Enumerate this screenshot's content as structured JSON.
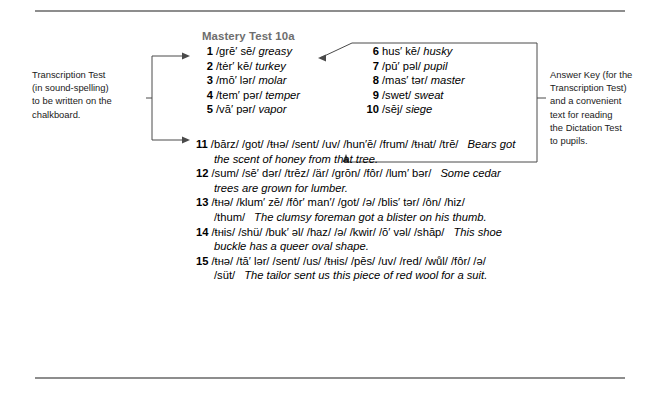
{
  "annotations": {
    "left": "Transcription Test\n(in sound-spelling)\nto be written on the\nchalkboard.",
    "right": "Answer Key (for the\nTranscription Test)\nand a convenient\ntext for reading\nthe Dictation Test\nto pupils."
  },
  "test": {
    "title": "Mastery Test 10a",
    "words_left": [
      {
        "num": "1",
        "phonetic": "/grē′ sē/",
        "word": "greasy"
      },
      {
        "num": "2",
        "phonetic": "/tėr′ kē/",
        "word": "turkey"
      },
      {
        "num": "3",
        "phonetic": "/mō′ lər/",
        "word": "molar"
      },
      {
        "num": "4",
        "phonetic": "/tem′ pər/",
        "word": "temper"
      },
      {
        "num": "5",
        "phonetic": "/vā′ pər/",
        "word": "vapor"
      }
    ],
    "words_right": [
      {
        "num": "6",
        "phonetic": "hus′ kē/",
        "word": "husky"
      },
      {
        "num": "7",
        "phonetic": "/pū′ pəl/",
        "word": "pupil"
      },
      {
        "num": "8",
        "phonetic": "/mas′ tər/",
        "word": "master"
      },
      {
        "num": "9",
        "phonetic": "/swet/",
        "word": "sweat"
      },
      {
        "num": "10",
        "phonetic": "/sēj/",
        "word": "siege"
      }
    ],
    "sentences": [
      {
        "num": "11",
        "phonetic": "/bārz/ /got/ /ŧнə/ /sent/ /uv/ /hun′ē/ /frum/ /ŧнat/ /trē/",
        "sentence": "Bears got the scent of honey from that tree."
      },
      {
        "num": "12",
        "phonetic": "/sum/ /sē′ dər/ /trēz/ /är/ /grōn/ /fôr/ /lum′ bər/",
        "sentence": "Some cedar trees are grown for lumber."
      },
      {
        "num": "13",
        "phonetic": "/ŧнə/ /klum′ zē/ /fôr′ man′/ /got/ /ə/ /blis′ tər/ /ôn/ /hiz/ /thum/",
        "sentence": "The clumsy foreman got a blister on his thumb."
      },
      {
        "num": "14",
        "phonetic": "/ŧнis/ /shü/ /buk′ əl/ /haz/ /ə/ /kwir/ /ō′ vəl/ /shāp/",
        "sentence": "This shoe buckle has a queer oval shape."
      },
      {
        "num": "15",
        "phonetic": "/ŧнə/ /tā′ lər/ /sent/ /us/ /ŧнis/ /pēs/ /uv/ /red/ /wůl/ /fôr/ /ə/ /süt/",
        "sentence": "The tailor sent us this piece of red wool for a suit."
      }
    ]
  }
}
